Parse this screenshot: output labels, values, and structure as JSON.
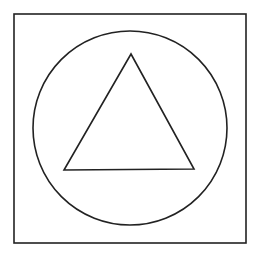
{
  "canvas": {
    "width": 260,
    "height": 259,
    "background": "#ffffff"
  },
  "stroke_color": "#222222",
  "shapes": {
    "square": {
      "x": 14,
      "y": 14,
      "width": 232,
      "height": 229
    },
    "circle": {
      "cx": 130,
      "cy": 128,
      "r": 97
    },
    "triangle": {
      "points": "131,54 64,170 194,169"
    }
  }
}
